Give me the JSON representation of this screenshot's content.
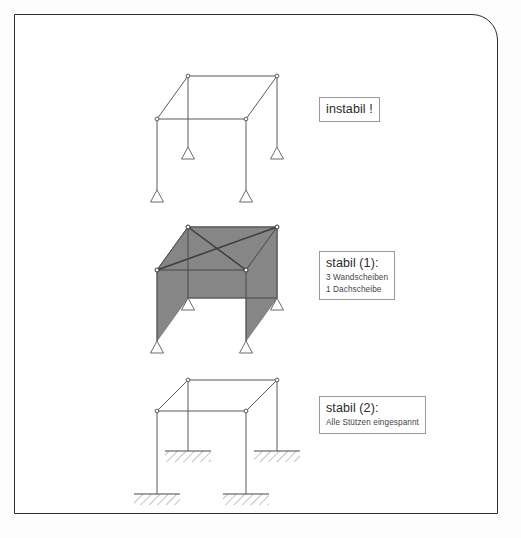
{
  "page": {
    "border_color": "#2b2b2b",
    "background": "#ffffff",
    "rounded_corner": "top-right"
  },
  "labels": [
    {
      "id": "instabil",
      "title": "instabil !",
      "lines": []
    },
    {
      "id": "stabil1",
      "title": "stabil (1):",
      "lines": [
        "3 Wandscheiben",
        "1 Dachscheibe"
      ]
    },
    {
      "id": "stabil2",
      "title": "stabil (2):",
      "lines": [
        "Alle Stützen eingespannt"
      ]
    }
  ],
  "figure": {
    "line_color": "#5a5a5a",
    "brace_color": "#3c3c3c",
    "panel_fill": "#868686",
    "node_fill": "#ffffff",
    "node_stroke": "#4a4a4a",
    "frames": [
      {
        "id": "frame-unstable",
        "caption": "instabil !",
        "support_type": "pinned",
        "panels": 0,
        "roof_bracing": false,
        "geometry": {
          "roof_back_left": [
            188,
            76
          ],
          "roof_back_right": [
            277,
            76
          ],
          "roof_front_left": [
            157,
            119
          ],
          "roof_front_right": [
            246,
            119
          ],
          "base_back_left": [
            188,
            147
          ],
          "base_back_right": [
            277,
            147
          ],
          "base_front_left": [
            157,
            190
          ],
          "base_front_right": [
            246,
            190
          ]
        }
      },
      {
        "id": "frame-stable-walls",
        "caption": "stabil (1)",
        "support_type": "pinned",
        "panels": 3,
        "roof_bracing": true,
        "geometry": {
          "roof_back_left": [
            188,
            227
          ],
          "roof_back_right": [
            277,
            227
          ],
          "roof_front_left": [
            157,
            270
          ],
          "roof_front_right": [
            246,
            270
          ],
          "base_back_left": [
            188,
            298
          ],
          "base_back_right": [
            277,
            298
          ],
          "base_front_left": [
            157,
            341
          ],
          "base_front_right": [
            246,
            341
          ]
        }
      },
      {
        "id": "frame-fixed-columns",
        "caption": "stabil (2)",
        "support_type": "fixed",
        "panels": 0,
        "roof_bracing": false,
        "geometry": {
          "roof_back_left": [
            188,
            380
          ],
          "roof_back_right": [
            277,
            380
          ],
          "roof_front_left": [
            157,
            411
          ],
          "roof_front_right": [
            246,
            411
          ],
          "base_back_left": [
            188,
            451
          ],
          "base_back_right": [
            277,
            451
          ],
          "base_front_left": [
            157,
            494
          ],
          "base_front_right": [
            246,
            494
          ]
        }
      }
    ]
  }
}
